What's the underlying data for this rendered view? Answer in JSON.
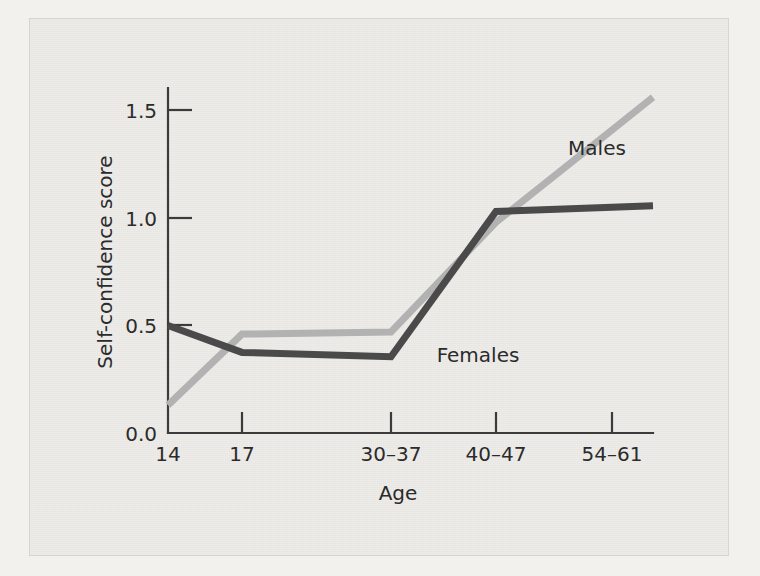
{
  "figure": {
    "background_color": "#edece9",
    "page_background_color": "#f2f1ee"
  },
  "chart_data": {
    "type": "line",
    "title": "",
    "subtitle": "",
    "xlabel": "Age",
    "ylabel": "Self-confidence score",
    "categories": [
      "14",
      "17",
      "30–37",
      "40–47",
      "54–61"
    ],
    "x_tick_labels": [
      "14",
      "17",
      "30–37",
      "40–47",
      "54–61"
    ],
    "y_tick_labels": [
      "0.0",
      "0.5",
      "1.0",
      "1.5"
    ],
    "y_ticks": [
      0.0,
      0.5,
      1.0,
      1.5
    ],
    "ylim": [
      0.0,
      1.55
    ],
    "grid": false,
    "legend_position": "inline-annotations",
    "series": [
      {
        "name": "Males",
        "color": "#b2b2b2",
        "values": [
          0.13,
          0.46,
          0.47,
          0.98,
          1.41
        ]
      },
      {
        "name": "Females",
        "color": "#4a4a4a",
        "values": [
          0.5,
          0.375,
          0.355,
          1.03,
          1.05
        ]
      }
    ],
    "annotations": [
      {
        "text": "Males",
        "series": "Males",
        "x": 597,
        "y": 148
      },
      {
        "text": "Females",
        "series": "Females",
        "x": 425,
        "y": 355
      }
    ]
  }
}
